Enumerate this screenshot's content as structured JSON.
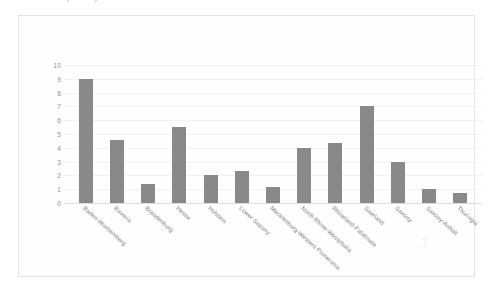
{
  "top_caption": "Number of companies by federal state",
  "watermark_glyph": "ℐ",
  "colors": {
    "bar": "#898989",
    "frame": "#e2e3e7",
    "gridline": "#f1f2f4",
    "axis_text": "#8d8f96"
  },
  "chart_data": {
    "type": "bar",
    "title": "",
    "xlabel": "",
    "ylabel": "",
    "ylim": [
      0,
      10
    ],
    "yticks": [
      0,
      1,
      2,
      3,
      4,
      5,
      6,
      7,
      8,
      9,
      10
    ],
    "grid": true,
    "legend": "none",
    "categories": [
      "Baden-Wurttemberg",
      "Bavaria",
      "Brandenburg",
      "Hesse",
      "Holstein",
      "Lower Saxony",
      "Mecklenburg-Western Pomerania",
      "North Rhine-Westphalia",
      "Rhineland-Palatinate",
      "Saarland",
      "Saxony",
      "Saxony-Anhalt",
      "Thuringia"
    ],
    "values": [
      9,
      4.6,
      1.4,
      5.5,
      2,
      2.35,
      1.15,
      4,
      4.35,
      7,
      3,
      1,
      0.7
    ]
  }
}
